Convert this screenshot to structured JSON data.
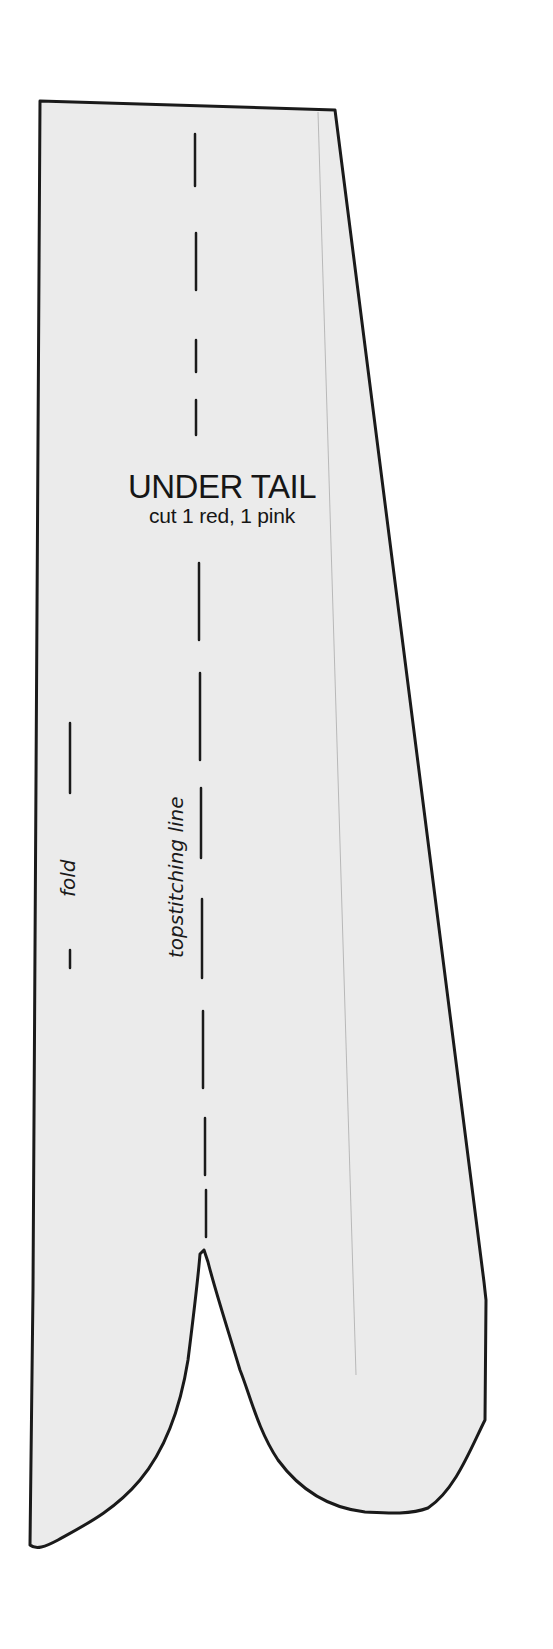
{
  "pattern_piece": {
    "title": "UNDER TAIL",
    "instructions": "cut 1 red, 1 pink",
    "labels": {
      "fold": "fold",
      "topstitching": "topstitching line"
    },
    "colors": {
      "background": "#ffffff",
      "fabric_fill": "#ebebeb",
      "outline": "#1a1a1a",
      "grain_line": "#b8b8b8"
    }
  }
}
